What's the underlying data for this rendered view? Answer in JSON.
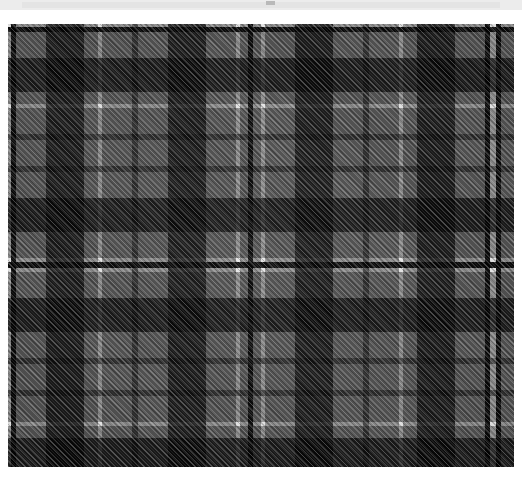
{
  "page": {
    "width": 522,
    "height": 486,
    "background": "#ffffff"
  },
  "top_banner": {
    "name": "top-banner",
    "background": "#ececec",
    "inner_background": "#e4e4e4",
    "mark_color": "#b9b9b9"
  },
  "swatch": {
    "name": "tartan-swatch",
    "x": 8,
    "y": 24,
    "width": 506,
    "height": 443,
    "weave": "twill",
    "twill_direction": "diagonal-up-right",
    "symmetry": "mirrored-sett"
  },
  "palette": {
    "white": "#f2f2f2",
    "light_gray": "#8f8f8f",
    "mid_gray": "#7a7a7a",
    "dark_gray": "#4a4a4a",
    "charcoal": "#2a2a2a",
    "black": "#0d0d0d"
  },
  "chart_data": {
    "type": "heatmap",
    "xlabel": "warp (vertical threads)",
    "ylabel": "weft (horizontal threads)",
    "grid": false,
    "legend": "none",
    "warp_stripes": [
      {
        "color": "#f2f2f2",
        "width": 3
      },
      {
        "color": "#0d0d0d",
        "width": 5
      },
      {
        "color": "#8f8f8f",
        "width": 30
      },
      {
        "color": "#2a2a2a",
        "width": 38
      },
      {
        "color": "#8f8f8f",
        "width": 14
      },
      {
        "color": "#f2f2f2",
        "width": 4
      },
      {
        "color": "#8f8f8f",
        "width": 30
      },
      {
        "color": "#4a4a4a",
        "width": 6
      },
      {
        "color": "#8f8f8f",
        "width": 30
      },
      {
        "color": "#2a2a2a",
        "width": 38
      },
      {
        "color": "#8f8f8f",
        "width": 30
      },
      {
        "color": "#f2f2f2",
        "width": 4
      },
      {
        "color": "#8f8f8f",
        "width": 8
      },
      {
        "color": "#0d0d0d",
        "width": 5
      },
      {
        "color": "#8f8f8f",
        "width": 8
      },
      {
        "color": "#f2f2f2",
        "width": 4
      },
      {
        "color": "#8f8f8f",
        "width": 30
      },
      {
        "color": "#2a2a2a",
        "width": 38
      },
      {
        "color": "#8f8f8f",
        "width": 30
      },
      {
        "color": "#4a4a4a",
        "width": 6
      },
      {
        "color": "#8f8f8f",
        "width": 30
      },
      {
        "color": "#f2f2f2",
        "width": 4
      },
      {
        "color": "#8f8f8f",
        "width": 14
      },
      {
        "color": "#2a2a2a",
        "width": 38
      },
      {
        "color": "#8f8f8f",
        "width": 30
      },
      {
        "color": "#0d0d0d",
        "width": 5
      },
      {
        "color": "#f2f2f2",
        "width": 3
      }
    ],
    "weft_stripes": [
      {
        "color": "#f2f2f2",
        "width": 3
      },
      {
        "color": "#0d0d0d",
        "width": 5
      },
      {
        "color": "#8f8f8f",
        "width": 26
      },
      {
        "color": "#2a2a2a",
        "width": 34
      },
      {
        "color": "#8f8f8f",
        "width": 12
      },
      {
        "color": "#f2f2f2",
        "width": 4
      },
      {
        "color": "#8f8f8f",
        "width": 26
      },
      {
        "color": "#4a4a4a",
        "width": 6
      },
      {
        "color": "#8f8f8f",
        "width": 26
      },
      {
        "color": "#4a4a4a",
        "width": 6
      },
      {
        "color": "#8f8f8f",
        "width": 26
      },
      {
        "color": "#2a2a2a",
        "width": 34
      },
      {
        "color": "#8f8f8f",
        "width": 26
      },
      {
        "color": "#f2f2f2",
        "width": 4
      },
      {
        "color": "#0d0d0d",
        "width": 6
      },
      {
        "color": "#f2f2f2",
        "width": 4
      },
      {
        "color": "#8f8f8f",
        "width": 26
      },
      {
        "color": "#2a2a2a",
        "width": 34
      },
      {
        "color": "#8f8f8f",
        "width": 26
      },
      {
        "color": "#4a4a4a",
        "width": 6
      },
      {
        "color": "#8f8f8f",
        "width": 26
      },
      {
        "color": "#4a4a4a",
        "width": 6
      },
      {
        "color": "#8f8f8f",
        "width": 26
      },
      {
        "color": "#f2f2f2",
        "width": 4
      },
      {
        "color": "#8f8f8f",
        "width": 12
      },
      {
        "color": "#2a2a2a",
        "width": 34
      },
      {
        "color": "#8f8f8f",
        "width": 26
      },
      {
        "color": "#0d0d0d",
        "width": 5
      },
      {
        "color": "#f2f2f2",
        "width": 3
      }
    ]
  }
}
